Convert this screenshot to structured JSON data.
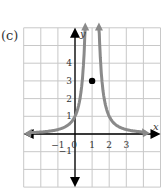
{
  "figure_label": "(c)",
  "chart_data": {
    "type": "line",
    "title": "",
    "xlabel": "x",
    "ylabel": "y",
    "xlim": [
      -3,
      5
    ],
    "ylim": [
      -3,
      6
    ],
    "grid": true,
    "x_ticks": [
      "-1",
      "0",
      "1",
      "2",
      "3"
    ],
    "y_ticks": [
      "4",
      "3",
      "2",
      "1",
      "-1"
    ],
    "series": [
      {
        "name": "curve",
        "description": "y = 1/(x-1)^2 shape, vertical asymptote at x=1, passes through (0,1) and (2,1), approaches 0 as |x| grows",
        "points": [
          [
            -2.8,
            0.07
          ],
          [
            -2,
            0.11
          ],
          [
            -1,
            0.25
          ],
          [
            0,
            1
          ],
          [
            0.5,
            4
          ],
          [
            0.6,
            6.25
          ],
          [
            1.4,
            6.25
          ],
          [
            1.5,
            4
          ],
          [
            2,
            1
          ],
          [
            3,
            0.25
          ],
          [
            4,
            0.11
          ],
          [
            4.2,
            0.1
          ]
        ],
        "color": "#8a8a8a"
      }
    ],
    "annotations": [
      {
        "type": "point",
        "x": 1,
        "y": 3,
        "filled": true,
        "color": "#000000"
      }
    ]
  },
  "colors": {
    "grid": "#c8c8c8",
    "axis": "#000000",
    "curve": "#8a8a8a"
  }
}
